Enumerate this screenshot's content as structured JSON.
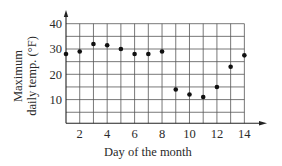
{
  "chart_data": {
    "type": "scatter",
    "title": "",
    "xlabel": "Day of the month",
    "ylabel_line1": "Maximum",
    "ylabel_line2": "daily temp. (°F)",
    "x": [
      1,
      2,
      3,
      4,
      5,
      6,
      7,
      8,
      9,
      10,
      11,
      12,
      13,
      14
    ],
    "values": [
      28,
      29,
      32,
      31.5,
      30,
      28,
      28,
      29,
      14,
      12,
      11,
      15,
      23,
      27.5
    ],
    "xticks": [
      2,
      4,
      6,
      8,
      10,
      12,
      14
    ],
    "yticks": [
      10,
      20,
      30,
      40
    ],
    "xlim": [
      1,
      14
    ],
    "ylim": [
      0,
      40
    ],
    "grid": true,
    "grid_x_step": 1,
    "grid_y_step": 5,
    "legend": null,
    "colors": {
      "point": "#111111",
      "grid": "#555555",
      "axis": "#222222"
    }
  }
}
